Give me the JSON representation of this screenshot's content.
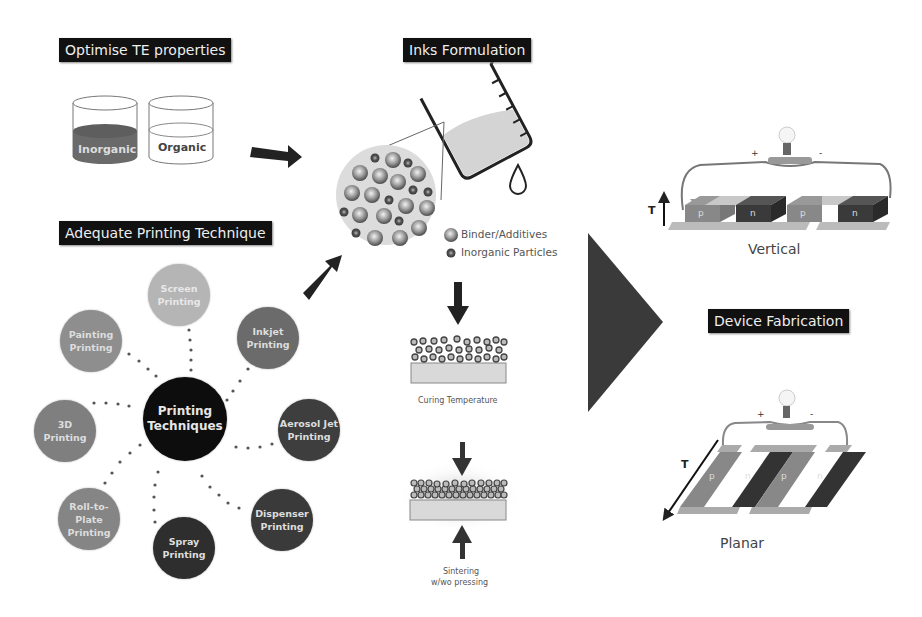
{
  "sections": {
    "optimise": {
      "title": "Optimise TE properties",
      "beakers": [
        {
          "label": "Inorganic"
        },
        {
          "label": "Organic"
        }
      ]
    },
    "inks": {
      "title": "Inks Formulation",
      "legend": [
        {
          "label": "Binder/Additives"
        },
        {
          "label": "Inorganic Particles"
        }
      ],
      "curing_label": "Curing Temperature",
      "sintering_label_line1": "Sintering",
      "sintering_label_line2": "w/wo pressing"
    },
    "printing": {
      "title": "Adequate Printing Technique",
      "center": {
        "line1": "Printing",
        "line2": "Techniques"
      },
      "techniques": [
        {
          "line1": "Screen",
          "line2": "Printing",
          "color": "#b5b5b5"
        },
        {
          "line1": "Painting",
          "line2": "Printing",
          "color": "#8e8e8e"
        },
        {
          "line1": "Inkjet",
          "line2": "Printing",
          "color": "#6b6b6b"
        },
        {
          "line1": "3D",
          "line2": "Printing",
          "color": "#7f7f7f"
        },
        {
          "line1": "Aerosol Jet",
          "line2": "Printing",
          "color": "#3e3e3e"
        },
        {
          "line1": "Roll-to-Plate",
          "line2": "Printing",
          "color": "#858585"
        },
        {
          "line1": "Spray",
          "line2": "Printing",
          "color": "#2e2e2e"
        },
        {
          "line1": "Dispenser",
          "line2": "Printing",
          "color": "#3a3a3a"
        }
      ]
    },
    "device": {
      "title": "Device Fabrication",
      "vertical": {
        "label": "Vertical",
        "axis": "T",
        "plus": "+",
        "minus": "-",
        "legs": [
          "p",
          "n",
          "p",
          "n"
        ]
      },
      "planar": {
        "label": "Planar",
        "axis": "T",
        "plus": "+",
        "minus": "-",
        "legs": [
          "p",
          "n",
          "p",
          "n"
        ]
      }
    }
  }
}
